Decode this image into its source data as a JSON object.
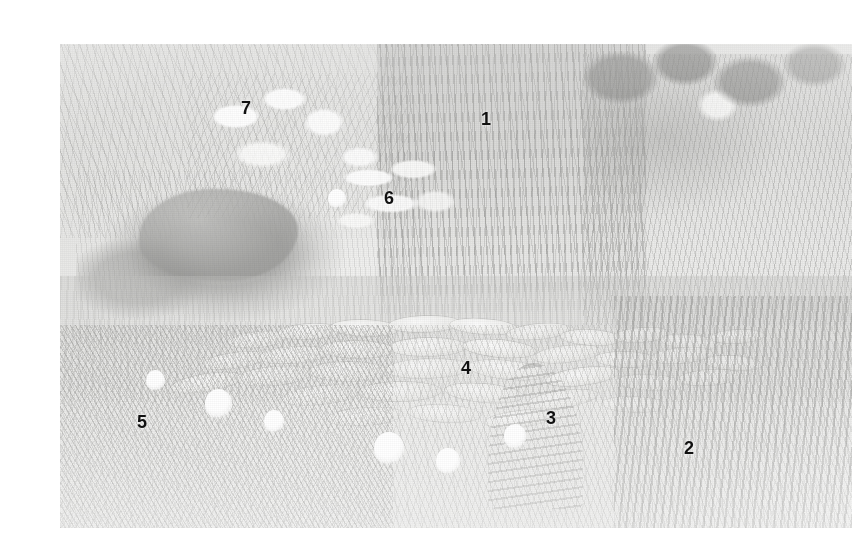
{
  "figure": {
    "kind": "photograph",
    "frame": {
      "left": 20,
      "top": 28,
      "width": 792,
      "height": 484
    },
    "page_background": "#ffffff",
    "ink_color": "#111111"
  },
  "annotations": [
    {
      "id": "label-1",
      "text": "1",
      "x": 441,
      "y": 94,
      "target": "tall reed stand behind the pond"
    },
    {
      "id": "label-2",
      "text": "2",
      "x": 644,
      "y": 423,
      "target": "iris clump at lower right"
    },
    {
      "id": "label-3",
      "text": "3",
      "x": 506,
      "y": 393,
      "target": "emergent blade-leaved plant"
    },
    {
      "id": "label-4",
      "text": "4",
      "x": 421,
      "y": 343,
      "target": "water lily pads on open water"
    },
    {
      "id": "label-5",
      "text": "5",
      "x": 97,
      "y": 397,
      "target": "sedge grass along the near bank"
    },
    {
      "id": "label-6",
      "text": "6",
      "x": 344,
      "y": 173,
      "target": "broad-leaved shrub mid-ground"
    },
    {
      "id": "label-7",
      "text": "7",
      "x": 201,
      "y": 83,
      "target": "flowering shrub on the far bank"
    }
  ],
  "regions": [
    {
      "name": "bank-upper-left",
      "label": "tall grass and sedge on the upper left bank"
    },
    {
      "name": "shrub-seven",
      "label": "flowering shrub"
    },
    {
      "name": "shaded-bank",
      "label": "shaded bank and stone"
    },
    {
      "name": "reed-stand",
      "label": "reed / cattail stand"
    },
    {
      "name": "broadleaf-six",
      "label": "broad-leaved plant"
    },
    {
      "name": "right-thicket",
      "label": "dense vegetation at right"
    },
    {
      "name": "top-right-leaves",
      "label": "broad leaves at top right"
    },
    {
      "name": "water",
      "label": "open water"
    },
    {
      "name": "lily-raft",
      "label": "raft of water lily pads"
    },
    {
      "name": "foreground-grass",
      "label": "foreground grass"
    },
    {
      "name": "blade-three",
      "label": "blade-leaved emergent plant"
    },
    {
      "name": "iris-two",
      "label": "iris clump"
    }
  ],
  "lily_pads": [
    {
      "x": 25.0,
      "y": 61.0,
      "w": 7.4,
      "h": 3.0,
      "r": -6
    },
    {
      "x": 31.5,
      "y": 59.5,
      "w": 8.0,
      "h": 3.1,
      "r": -3
    },
    {
      "x": 38.5,
      "y": 58.6,
      "w": 8.6,
      "h": 3.3,
      "r": 2
    },
    {
      "x": 46.0,
      "y": 58.0,
      "w": 9.0,
      "h": 3.4,
      "r": -2
    },
    {
      "x": 53.5,
      "y": 58.4,
      "w": 8.4,
      "h": 3.2,
      "r": 4
    },
    {
      "x": 60.5,
      "y": 59.4,
      "w": 8.0,
      "h": 3.1,
      "r": -5
    },
    {
      "x": 67.0,
      "y": 60.6,
      "w": 7.6,
      "h": 3.0,
      "r": 3
    },
    {
      "x": 73.5,
      "y": 60.0,
      "w": 7.0,
      "h": 2.8,
      "r": -4
    },
    {
      "x": 79.5,
      "y": 61.6,
      "w": 7.2,
      "h": 2.9,
      "r": 5
    },
    {
      "x": 85.5,
      "y": 60.4,
      "w": 6.8,
      "h": 2.7,
      "r": -3
    },
    {
      "x": 22.0,
      "y": 65.4,
      "w": 8.2,
      "h": 3.2,
      "r": -8
    },
    {
      "x": 29.5,
      "y": 64.2,
      "w": 8.8,
      "h": 3.4,
      "r": -4
    },
    {
      "x": 37.5,
      "y": 63.2,
      "w": 9.4,
      "h": 3.6,
      "r": 1
    },
    {
      "x": 46.5,
      "y": 62.6,
      "w": 9.8,
      "h": 3.7,
      "r": -1
    },
    {
      "x": 55.5,
      "y": 63.0,
      "w": 9.2,
      "h": 3.5,
      "r": 5
    },
    {
      "x": 64.0,
      "y": 64.0,
      "w": 8.6,
      "h": 3.3,
      "r": -6
    },
    {
      "x": 71.5,
      "y": 65.2,
      "w": 8.0,
      "h": 3.1,
      "r": 2
    },
    {
      "x": 78.5,
      "y": 64.4,
      "w": 7.6,
      "h": 3.0,
      "r": -5
    },
    {
      "x": 85.0,
      "y": 66.0,
      "w": 7.2,
      "h": 2.9,
      "r": 4
    },
    {
      "x": 18.5,
      "y": 70.0,
      "w": 9.0,
      "h": 3.5,
      "r": -9
    },
    {
      "x": 27.0,
      "y": 68.6,
      "w": 9.6,
      "h": 3.7,
      "r": -5
    },
    {
      "x": 36.5,
      "y": 67.6,
      "w": 10.2,
      "h": 3.9,
      "r": 0
    },
    {
      "x": 46.5,
      "y": 67.0,
      "w": 10.6,
      "h": 4.0,
      "r": -2
    },
    {
      "x": 56.5,
      "y": 67.4,
      "w": 10.0,
      "h": 3.8,
      "r": 6
    },
    {
      "x": 66.0,
      "y": 68.6,
      "w": 9.2,
      "h": 3.5,
      "r": -7
    },
    {
      "x": 74.5,
      "y": 70.0,
      "w": 8.4,
      "h": 3.2,
      "r": 3
    },
    {
      "x": 82.0,
      "y": 69.0,
      "w": 8.0,
      "h": 3.1,
      "r": -4
    },
    {
      "x": 33.0,
      "y": 72.6,
      "w": 10.0,
      "h": 3.8,
      "r": -6
    },
    {
      "x": 43.0,
      "y": 71.8,
      "w": 10.4,
      "h": 4.0,
      "r": -1
    },
    {
      "x": 53.5,
      "y": 72.2,
      "w": 9.8,
      "h": 3.7,
      "r": 5
    },
    {
      "x": 63.5,
      "y": 73.4,
      "w": 9.0,
      "h": 3.4,
      "r": -8
    },
    {
      "x": 72.5,
      "y": 74.6,
      "w": 8.2,
      "h": 3.2,
      "r": 2
    },
    {
      "x": 38.5,
      "y": 77.0,
      "w": 9.6,
      "h": 3.6,
      "r": -4
    },
    {
      "x": 48.5,
      "y": 76.4,
      "w": 9.2,
      "h": 3.5,
      "r": 3
    },
    {
      "x": 58.0,
      "y": 77.4,
      "w": 8.6,
      "h": 3.3,
      "r": -6
    }
  ],
  "flowers": [
    {
      "x": 20.0,
      "y": 73.0,
      "d": 3.4
    },
    {
      "x": 41.5,
      "y": 82.0,
      "d": 3.8
    },
    {
      "x": 27.0,
      "y": 77.0,
      "d": 2.6
    },
    {
      "x": 57.5,
      "y": 80.0,
      "d": 2.8
    },
    {
      "x": 35.0,
      "y": 31.0,
      "d": 2.2
    },
    {
      "x": 49.0,
      "y": 85.0,
      "d": 3.0
    },
    {
      "x": 12.0,
      "y": 68.5,
      "d": 2.4
    }
  ]
}
